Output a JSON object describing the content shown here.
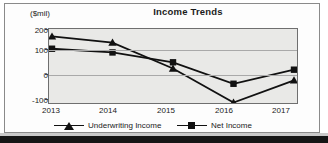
{
  "chart_data": {
    "type": "line",
    "title": "Income Trends",
    "ylabel": "($mil)",
    "xlabel": "",
    "categories": [
      "2013",
      "2014",
      "2015",
      "2016",
      "2017"
    ],
    "yticks": [
      "200",
      "100",
      "0",
      "-100"
    ],
    "ytick_values": [
      200,
      100,
      0,
      -100
    ],
    "ylim": [
      -100,
      200
    ],
    "grid": true,
    "legend_position": "bottom",
    "series": [
      {
        "name": "Underwriting Income",
        "marker": "triangle",
        "color": "#111111",
        "values": [
          170,
          145,
          40,
          -98,
          -8
        ]
      },
      {
        "name": "Net Income",
        "marker": "square",
        "color": "#111111",
        "values": [
          120,
          105,
          65,
          -22,
          35
        ]
      }
    ]
  },
  "legend": {
    "entries": [
      {
        "label": "Underwriting Income",
        "marker": "triangle-marker-icon"
      },
      {
        "label": "Net Income",
        "marker": "square-marker-icon"
      }
    ]
  }
}
